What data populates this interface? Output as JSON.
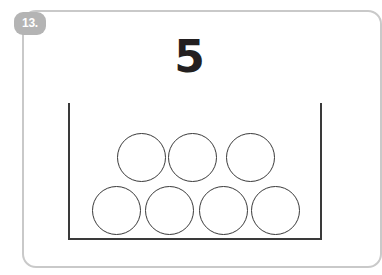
{
  "worksheet": {
    "problem_number": "13.",
    "target_number": "5",
    "frame_color": "#c9c9c9",
    "badge_color": "#b4b4b4",
    "ink_color": "#231f20",
    "outline_color": "#3a3a3a"
  },
  "counters": {
    "total_drawn": 7,
    "rows": [
      {
        "row_name": "top-row",
        "count": 3,
        "items": [
          {
            "label": "counter-1",
            "x": 117,
            "y": 133
          },
          {
            "label": "counter-2",
            "x": 168,
            "y": 133
          },
          {
            "label": "counter-3",
            "x": 226,
            "y": 133
          }
        ]
      },
      {
        "row_name": "bottom-row",
        "count": 4,
        "items": [
          {
            "label": "counter-4",
            "x": 92,
            "y": 186
          },
          {
            "label": "counter-5",
            "x": 145,
            "y": 186
          },
          {
            "label": "counter-6",
            "x": 199,
            "y": 186
          },
          {
            "label": "counter-7",
            "x": 251,
            "y": 186
          }
        ]
      }
    ]
  }
}
